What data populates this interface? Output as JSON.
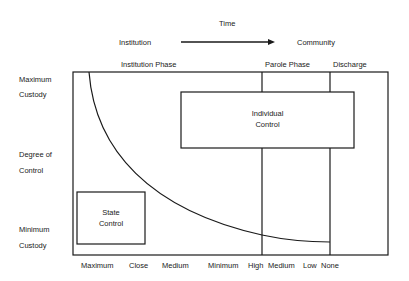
{
  "header": {
    "time_label": "Time",
    "from_label": "Institution",
    "to_label": "Community"
  },
  "phases": [
    {
      "label": "Institution Phase"
    },
    {
      "label": "Parole Phase"
    },
    {
      "label": "Discharge"
    }
  ],
  "y_axis": {
    "top_line1": "Maximum",
    "top_line2": "Custody",
    "mid_line1": "Degree of",
    "mid_line2": "Control",
    "bottom_line1": "Minimum",
    "bottom_line2": "Custody"
  },
  "x_axis": {
    "ticks": [
      "Maximum",
      "Close",
      "Medium",
      "Minimum",
      "High",
      "Medium",
      "Low",
      "None"
    ]
  },
  "boxes": {
    "individual_line1": "Individual",
    "individual_line2": "Control",
    "state_line1": "State",
    "state_line2": "Control"
  },
  "colors": {
    "line": "#1a1a1a",
    "text": "#222222"
  }
}
